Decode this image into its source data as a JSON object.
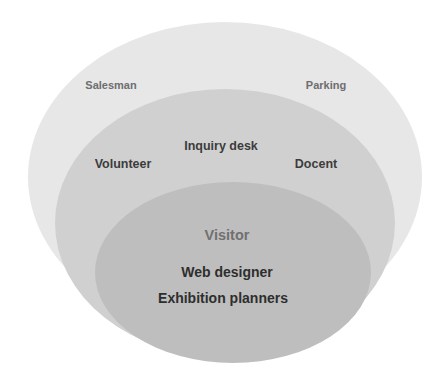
{
  "diagram": {
    "type": "nested-ellipses",
    "layers": [
      {
        "id": "outer",
        "fill": "#e7e7e7",
        "text_color": "#6e6e6e",
        "labels": [
          {
            "text": "Salesman",
            "x": 111,
            "y": 85
          },
          {
            "text": "Parking",
            "x": 326,
            "y": 85
          }
        ]
      },
      {
        "id": "middle",
        "fill": "#d0d0d0",
        "text_color": "#3c3c3c",
        "labels": [
          {
            "text": "Inquiry desk",
            "x": 221,
            "y": 146
          },
          {
            "text": "Volunteer",
            "x": 123,
            "y": 164
          },
          {
            "text": "Docent",
            "x": 316,
            "y": 164
          }
        ]
      },
      {
        "id": "inner",
        "fill": "#bebebe",
        "text_color": "#2e2e2e",
        "title": {
          "text": "Visitor",
          "x": 227,
          "y": 235,
          "color": "#707070"
        },
        "labels": [
          {
            "text": "Web designer",
            "x": 227,
            "y": 272
          },
          {
            "text": "Exhibition planners",
            "x": 223,
            "y": 298
          }
        ]
      }
    ]
  },
  "colors": {
    "background": "#ffffff",
    "outer_fill": "#e7e7e7",
    "middle_fill": "#d0d0d0",
    "inner_fill": "#bebebe"
  }
}
